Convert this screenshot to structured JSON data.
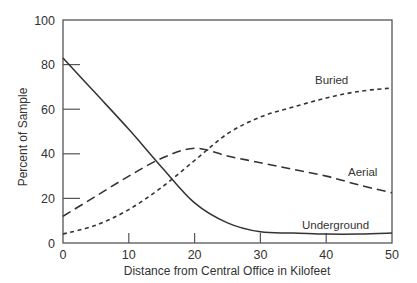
{
  "chart_data": {
    "type": "line",
    "title": "",
    "xlabel": "Distance from Central Office in Kilofeet",
    "ylabel": "Percent of Sample",
    "xlim": [
      0,
      50
    ],
    "ylim": [
      0,
      100
    ],
    "xticks": [
      0,
      10,
      20,
      30,
      40,
      50
    ],
    "yticks": [
      0,
      20,
      40,
      60,
      80,
      100
    ],
    "grid": false,
    "legend": "inline labels",
    "x": [
      0,
      5,
      10,
      15,
      20,
      25,
      30,
      35,
      40,
      45,
      50
    ],
    "series": [
      {
        "name": "Underground",
        "style": "solid",
        "values": [
          83,
          67,
          51,
          34,
          18,
          9,
          5,
          4.5,
          4,
          4,
          4.5
        ],
        "label_pos": [
          302,
          229
        ]
      },
      {
        "name": "Aerial",
        "style": "long-dash",
        "values": [
          12,
          21,
          30,
          38,
          42.5,
          39,
          36,
          33,
          30,
          26,
          22.5
        ],
        "label_pos": [
          348,
          176
        ]
      },
      {
        "name": "Buried",
        "style": "short-dash",
        "values": [
          4,
          8,
          15,
          25,
          37,
          49,
          56.5,
          61,
          65,
          68,
          69.5
        ],
        "label_pos": [
          315,
          84
        ]
      }
    ]
  },
  "plot": {
    "left": 63,
    "right": 392,
    "top": 20,
    "bottom": 243,
    "line_color": "#333333",
    "axis_color": "#555555"
  }
}
